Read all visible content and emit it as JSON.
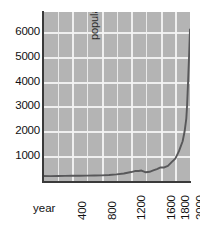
{
  "chart_data": {
    "type": "line",
    "title": "",
    "subtitle": "",
    "xlabel": "year",
    "ylabel": "population in millions",
    "xlim": [
      0,
      2000
    ],
    "ylim": [
      0,
      6800
    ],
    "grid": true,
    "legend": null,
    "x_ticks": [
      400,
      800,
      1200,
      1600,
      1800,
      2000
    ],
    "x_tick_labels": [
      "400",
      "800",
      "1200",
      "1600",
      "1800",
      "2000"
    ],
    "y_ticks": [
      1000,
      2000,
      3000,
      4000,
      5000,
      6000
    ],
    "y_tick_labels": [
      "1000",
      "2000",
      "3000",
      "4000",
      "5000",
      "6000"
    ],
    "x_gridline_step": 200,
    "y_gridline_step": 1000,
    "series": [
      {
        "name": "world population",
        "color": "#58585a",
        "x": [
          0,
          100,
          200,
          300,
          400,
          500,
          600,
          700,
          800,
          900,
          1000,
          1100,
          1200,
          1250,
          1300,
          1340,
          1400,
          1450,
          1500,
          1550,
          1600,
          1650,
          1700,
          1750,
          1800,
          1850,
          1900,
          1927,
          1950,
          1960,
          1975,
          1987,
          1999,
          2000
        ],
        "y": [
          200,
          195,
          200,
          205,
          210,
          210,
          215,
          220,
          225,
          240,
          265,
          300,
          360,
          400,
          400,
          420,
          350,
          370,
          425,
          480,
          545,
          545,
          610,
          760,
          900,
          1200,
          1600,
          2000,
          2520,
          3020,
          4070,
          5000,
          6000,
          6100
        ]
      }
    ],
    "annotations": []
  },
  "colors": {
    "page_background": "#ffffff",
    "plot_background": "#b4b4b4",
    "gridline": "#efefef",
    "axis": "#3a3a3a",
    "series": "#58585a",
    "tick_text": "#111111",
    "axis_title": "#111111"
  }
}
